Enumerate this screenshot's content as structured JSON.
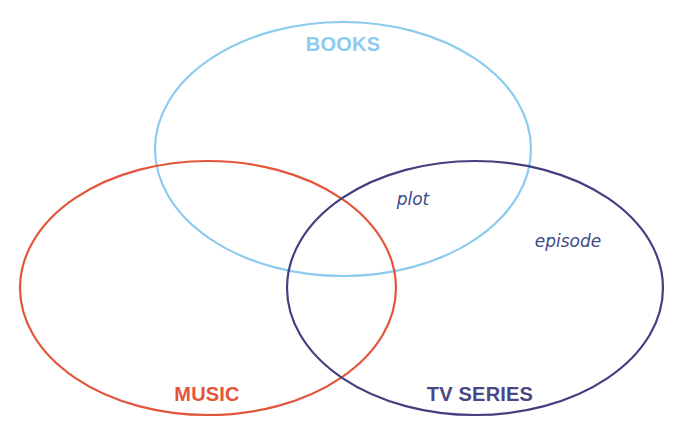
{
  "diagram": {
    "type": "venn",
    "background": "#ffffff",
    "sets": [
      {
        "id": "books",
        "label": "BOOKS",
        "color": "#8ccbee",
        "label_color": "#8ccbee",
        "cx": 343,
        "cy": 149,
        "rx": 188,
        "ry": 127,
        "label_x": 343,
        "label_y": 51
      },
      {
        "id": "music",
        "label": "MUSIC",
        "color": "#e2553a",
        "label_color": "#e2553a",
        "cx": 208,
        "cy": 288,
        "rx": 188,
        "ry": 127,
        "label_x": 207,
        "label_y": 401
      },
      {
        "id": "tv_series",
        "label": "TV SERIES",
        "color": "#443f7e",
        "label_color": "#4b4785",
        "cx": 475,
        "cy": 288,
        "rx": 188,
        "ry": 127,
        "label_x": 480,
        "label_y": 401
      }
    ],
    "items": [
      {
        "text": "plot",
        "region": "books ∩ tv_series",
        "x": 413,
        "y": 205,
        "color": "#3b4a86"
      },
      {
        "text": "episode",
        "region": "tv_series",
        "x": 568,
        "y": 247,
        "color": "#3b4a86"
      }
    ]
  }
}
